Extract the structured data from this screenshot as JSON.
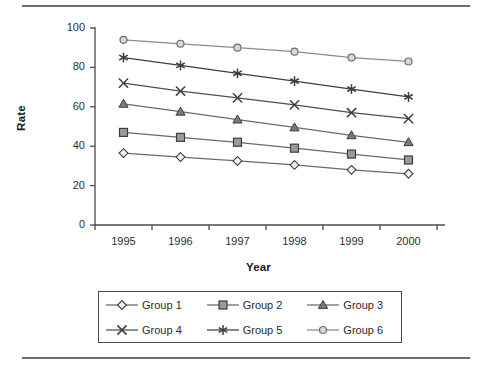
{
  "chart_data": {
    "type": "line",
    "title": "",
    "subtitle": "",
    "xlabel": "Year",
    "ylabel": "Rate",
    "categories": [
      "1995",
      "1996",
      "1997",
      "1998",
      "1999",
      "2000"
    ],
    "x": [
      1995,
      1996,
      1997,
      1998,
      1999,
      2000
    ],
    "ylim": [
      0,
      100
    ],
    "yticks": [
      0,
      20,
      40,
      60,
      80,
      100
    ],
    "ytick_labels": [
      "0",
      "20",
      "40",
      "60",
      "80",
      "100"
    ],
    "xtick_labels": [
      "1995",
      "1996",
      "1997",
      "1998",
      "1999",
      "2000"
    ],
    "grid": false,
    "legend_position": "below-center",
    "legend_columns": 3,
    "series": [
      {
        "name": "Group 1",
        "marker": "diamond-open",
        "color": "#6b6b6b",
        "values": [
          36.5,
          34.5,
          32.5,
          30.5,
          28.0,
          26.0
        ]
      },
      {
        "name": "Group 2",
        "marker": "square-filled",
        "color": "#6b6b6b",
        "values": [
          47.0,
          44.5,
          42.0,
          39.0,
          36.0,
          33.0
        ]
      },
      {
        "name": "Group 3",
        "marker": "triangle-filled",
        "color": "#6b6b6b",
        "values": [
          61.5,
          57.5,
          53.5,
          49.5,
          45.5,
          42.0
        ]
      },
      {
        "name": "Group 4",
        "marker": "x-cross",
        "color": "#4f4f4f",
        "values": [
          72.0,
          68.0,
          64.5,
          61.0,
          57.0,
          54.0
        ]
      },
      {
        "name": "Group 5",
        "marker": "asterisk-star",
        "color": "#3f3f3f",
        "values": [
          85.0,
          81.0,
          77.0,
          73.0,
          69.0,
          65.0
        ]
      },
      {
        "name": "Group 6",
        "marker": "circle-open",
        "color": "#8c8c8c",
        "values": [
          94.0,
          92.0,
          90.0,
          88.0,
          85.0,
          83.0
        ]
      }
    ]
  },
  "axis": {
    "y_title": "Rate",
    "x_title": "Year"
  },
  "legend": {
    "items": [
      {
        "label": "Group 1"
      },
      {
        "label": "Group 2"
      },
      {
        "label": "Group 3"
      },
      {
        "label": "Group 4"
      },
      {
        "label": "Group 5"
      },
      {
        "label": "Group 6"
      }
    ]
  },
  "style": {
    "axis_color": "#4a4a4a",
    "text_color": "#2a2a2a",
    "rule_color": "#6d6d6d",
    "background": "#ffffff"
  }
}
